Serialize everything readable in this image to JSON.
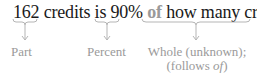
{
  "sentence": {
    "part": "162",
    "text1": " credits is ",
    "percent": "90%",
    "space": " ",
    "of": "of",
    "whole": " how many credits?"
  },
  "labels": {
    "part": "Part",
    "percent": "Percent",
    "whole_line1": "Whole (unknown);",
    "whole_line2_pre": "(follows ",
    "whole_line2_of": "of",
    "whole_line2_post": ")"
  },
  "colors": {
    "text": "#1a1a1a",
    "annotation": "#9a9a9a"
  }
}
